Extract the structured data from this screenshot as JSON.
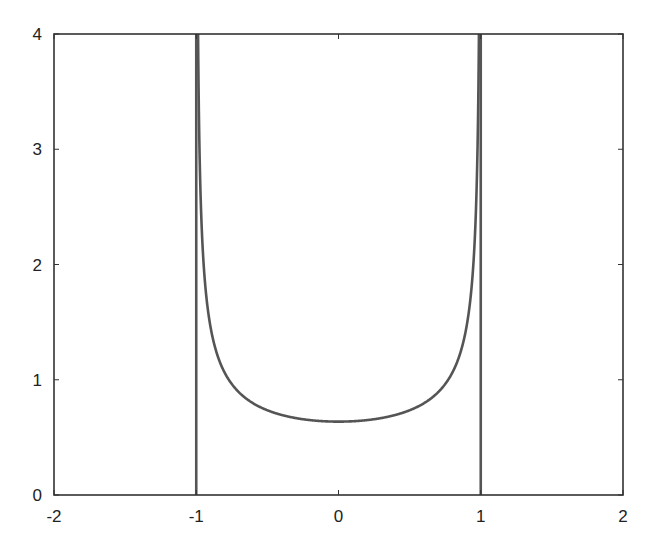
{
  "chart_data": {
    "type": "line",
    "title": "",
    "xlabel": "",
    "ylabel": "",
    "xlim": [
      -2,
      2
    ],
    "ylim": [
      0,
      4
    ],
    "grid": false,
    "legend": null,
    "x_ticks": [
      -2,
      -1,
      0,
      1,
      2
    ],
    "x_tick_labels": [
      "-2",
      "-1",
      "0",
      "1",
      "2"
    ],
    "y_ticks": [
      0,
      1,
      2,
      3,
      4
    ],
    "y_tick_labels": [
      "0",
      "1",
      "2",
      "3",
      "4"
    ],
    "series": [
      {
        "name": "density curve",
        "formula": "2/(pi*sqrt(1-x^2)) for -1<x<1",
        "x": [
          -0.999,
          -0.99,
          -0.98,
          -0.96,
          -0.94,
          -0.92,
          -0.9,
          -0.85,
          -0.8,
          -0.7,
          -0.6,
          -0.5,
          -0.4,
          -0.3,
          -0.2,
          -0.1,
          0,
          0.1,
          0.2,
          0.3,
          0.4,
          0.5,
          0.6,
          0.7,
          0.8,
          0.85,
          0.9,
          0.92,
          0.94,
          0.96,
          0.98,
          0.99,
          0.999
        ],
        "y": [
          14.24,
          4.51,
          3.2,
          2.27,
          1.87,
          1.62,
          1.46,
          1.21,
          1.06,
          0.89,
          0.8,
          0.74,
          0.69,
          0.67,
          0.65,
          0.64,
          0.637,
          0.64,
          0.65,
          0.67,
          0.69,
          0.74,
          0.8,
          0.89,
          1.06,
          1.21,
          1.46,
          1.62,
          1.87,
          2.27,
          3.2,
          4.51,
          14.24
        ]
      },
      {
        "name": "left vertical line",
        "x": [
          -1,
          -1
        ],
        "y": [
          0,
          4
        ]
      },
      {
        "name": "right vertical line",
        "x": [
          1,
          1
        ],
        "y": [
          0,
          4
        ]
      }
    ],
    "annotations": [
      {
        "type": "minimum",
        "x": 0,
        "y": 0.637
      }
    ],
    "colors": {
      "axes": "#333333",
      "curve": "#555555",
      "background": "#ffffff"
    }
  }
}
